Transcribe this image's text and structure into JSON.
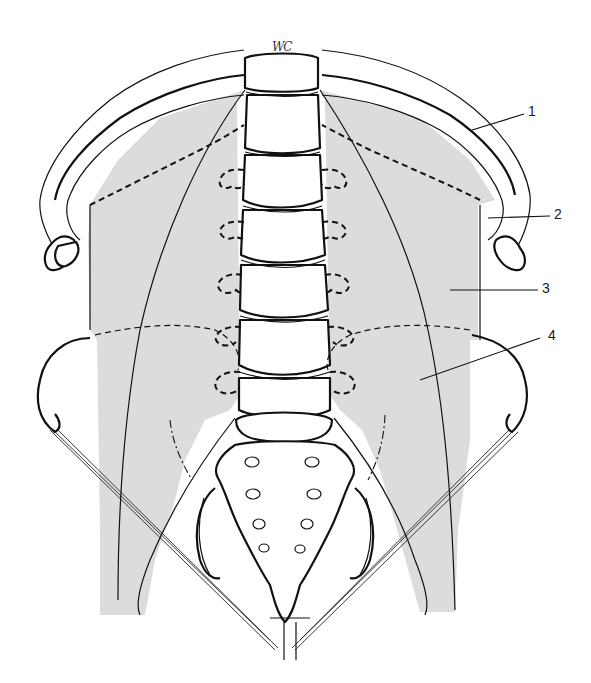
{
  "figure": {
    "type": "anatomical line drawing",
    "shade_color": "#dcdcdc",
    "line_color": "#111111",
    "background": "#ffffff",
    "signature": "WC"
  },
  "labels": [
    {
      "id": "1",
      "text": "1",
      "x": 528,
      "y": 128
    },
    {
      "id": "2",
      "text": "2",
      "x": 560,
      "y": 207
    },
    {
      "id": "3",
      "text": "3",
      "x": 543,
      "y": 281
    },
    {
      "id": "4",
      "text": "4",
      "x": 548,
      "y": 330
    }
  ]
}
